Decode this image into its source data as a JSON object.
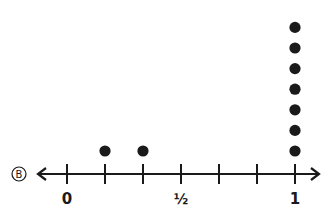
{
  "problem_label": "B",
  "chart_data": {
    "type": "dot_plot",
    "title": "",
    "xlabel": "",
    "ylabel": "",
    "xlim": [
      0,
      1
    ],
    "tick_step": "1/6",
    "ticks": [
      0,
      0.1667,
      0.3333,
      0.5,
      0.6667,
      0.8333,
      1
    ],
    "tick_labels": [
      {
        "value": 0,
        "label": "0"
      },
      {
        "value": 0.5,
        "label": "½"
      },
      {
        "value": 1,
        "label": "1"
      }
    ],
    "points": [
      {
        "x": "1/6",
        "value": 0.1667,
        "count": 1
      },
      {
        "x": "2/6",
        "value": 0.3333,
        "count": 1
      },
      {
        "x": "1",
        "value": 1,
        "count": 7
      }
    ],
    "grid": false,
    "legend": null
  },
  "colors": {
    "ink": "#1a1a1a",
    "background": "#ffffff"
  }
}
